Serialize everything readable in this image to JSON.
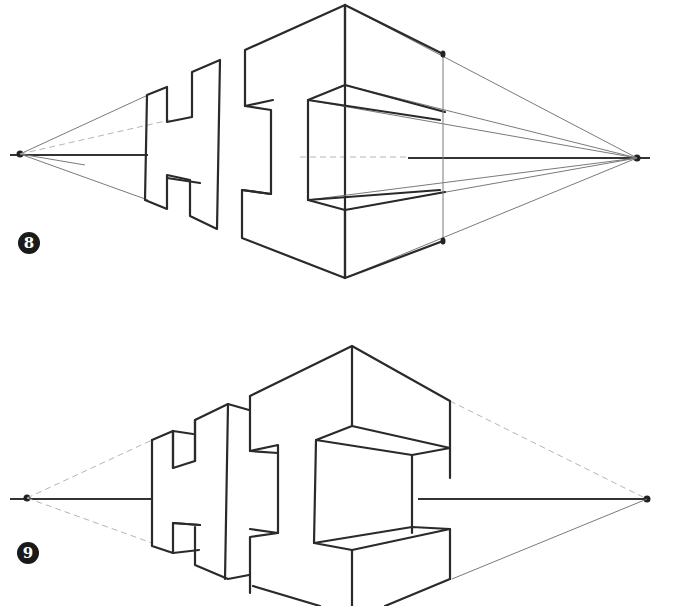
{
  "figure": {
    "steps": [
      {
        "number": "8",
        "label": "step-8",
        "description": "Two-point perspective construction of letters H and I with vanishing points on horizon line"
      },
      {
        "number": "9",
        "label": "step-9",
        "description": "Refined block letters H and I with construction lines erased"
      }
    ],
    "colors": {
      "ink": "#2a2a2a",
      "guide": "#7a7a7a",
      "badge": "#1a1a1a",
      "background": "#ffffff"
    }
  }
}
